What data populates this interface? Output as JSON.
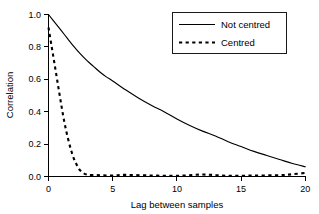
{
  "chart_data": {
    "type": "line",
    "title": "",
    "xlabel": "Lag between samples",
    "ylabel": "Correlation",
    "xlim": [
      0,
      20
    ],
    "ylim": [
      0.0,
      1.0
    ],
    "xticks": [
      0,
      5,
      10,
      15,
      20
    ],
    "xtick_labels": [
      "0",
      "5",
      "10",
      "15",
      "20"
    ],
    "yticks": [
      0.0,
      0.2,
      0.4,
      0.6,
      0.8,
      1.0
    ],
    "ytick_labels": [
      "0.0",
      "0.2",
      "0.4",
      "0.6",
      "0.8",
      "1.0"
    ],
    "grid": false,
    "legend_position": "top-right",
    "series": [
      {
        "name": "Not centred",
        "style": "solid",
        "color": "#000000",
        "x": [
          0,
          0.5,
          1,
          1.5,
          2,
          2.5,
          3,
          3.5,
          4,
          4.5,
          5,
          6,
          7,
          8,
          9,
          10,
          11,
          12,
          13,
          14,
          15,
          16,
          17,
          18,
          19,
          20
        ],
        "values": [
          1.0,
          0.95,
          0.9,
          0.85,
          0.8,
          0.755,
          0.715,
          0.68,
          0.645,
          0.615,
          0.59,
          0.535,
          0.485,
          0.44,
          0.4,
          0.355,
          0.315,
          0.28,
          0.25,
          0.215,
          0.185,
          0.155,
          0.13,
          0.105,
          0.08,
          0.06
        ]
      },
      {
        "name": "Centred",
        "style": "dashed",
        "color": "#000000",
        "x": [
          0,
          0.25,
          0.5,
          0.75,
          1,
          1.25,
          1.5,
          1.75,
          2,
          2.25,
          2.5,
          3,
          4,
          5,
          6,
          8,
          10,
          12,
          14,
          16,
          18,
          19,
          20
        ],
        "values": [
          0.92,
          0.8,
          0.68,
          0.56,
          0.44,
          0.33,
          0.24,
          0.165,
          0.105,
          0.065,
          0.035,
          0.012,
          0.008,
          0.006,
          0.01,
          0.006,
          0.004,
          0.012,
          0.004,
          0.006,
          0.008,
          0.014,
          0.022
        ]
      }
    ],
    "legend_entries": [
      {
        "label": "Not centred",
        "style": "solid"
      },
      {
        "label": "Centred",
        "style": "dashed"
      }
    ]
  }
}
